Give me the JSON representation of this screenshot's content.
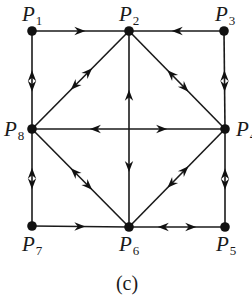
{
  "diagram": {
    "caption": "(c)",
    "colors": {
      "ink": "#111111",
      "background": "#ffffff"
    },
    "nodes": [
      {
        "id": "P1",
        "label": "P",
        "sub": "1",
        "x": 32,
        "y": 31
      },
      {
        "id": "P2",
        "label": "P",
        "sub": "2",
        "x": 129,
        "y": 31
      },
      {
        "id": "P3",
        "label": "P",
        "sub": "3",
        "x": 224,
        "y": 31
      },
      {
        "id": "P4",
        "label": "P",
        "sub": "4",
        "x": 225,
        "y": 129
      },
      {
        "id": "P5",
        "label": "P",
        "sub": "5",
        "x": 225,
        "y": 227
      },
      {
        "id": "P6",
        "label": "P",
        "sub": "6",
        "x": 129,
        "y": 227
      },
      {
        "id": "P7",
        "label": "P",
        "sub": "7",
        "x": 32,
        "y": 226
      },
      {
        "id": "P8",
        "label": "P",
        "sub": "8",
        "x": 32,
        "y": 129
      }
    ],
    "edges": [
      {
        "from": "P1",
        "to": "P2",
        "direction": "P1->P2"
      },
      {
        "from": "P3",
        "to": "P2",
        "direction": "P3->P2"
      },
      {
        "from": "P1",
        "to": "P8",
        "direction": "both"
      },
      {
        "from": "P3",
        "to": "P4",
        "direction": "both"
      },
      {
        "from": "P8",
        "to": "P7",
        "direction": "both"
      },
      {
        "from": "P4",
        "to": "P5",
        "direction": "both"
      },
      {
        "from": "P7",
        "to": "P6",
        "direction": "P7->P6"
      },
      {
        "from": "P6",
        "to": "P5",
        "direction": "both"
      },
      {
        "from": "P8",
        "to": "P2",
        "direction": "both"
      },
      {
        "from": "P2",
        "to": "P4",
        "direction": "both"
      },
      {
        "from": "P8",
        "to": "P6",
        "direction": "both"
      },
      {
        "from": "P6",
        "to": "P4",
        "direction": "both"
      },
      {
        "from": "P8",
        "to": "P4",
        "direction": "both"
      },
      {
        "from": "P2",
        "to": "P6",
        "direction": "both"
      }
    ]
  }
}
